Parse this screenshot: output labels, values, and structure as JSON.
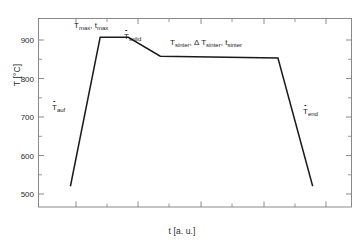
{
  "chart_data": {
    "type": "line",
    "title": "",
    "subtitle": "",
    "xlabel": "t [a. u.]",
    "ylabel": "T [°C]",
    "xlim": [
      0,
      100
    ],
    "ylim": [
      450,
      950
    ],
    "grid": false,
    "legend": "none",
    "x_tick_labels": [],
    "y_tick_labels": [
      "500",
      "600",
      "700",
      "800",
      "900"
    ],
    "y_ticks": [
      500,
      600,
      700,
      800,
      900
    ],
    "y_minor_ticks": [
      450,
      550,
      650,
      750,
      850,
      950
    ],
    "x_major_ticks": [
      10,
      30,
      50,
      70,
      90
    ],
    "x_minor_ticks": [
      20,
      40,
      60,
      80
    ],
    "series": [
      {
        "name": "sintering temperature profile",
        "x": [
          10.2,
          19.7,
          28.7,
          38.9,
          76.5,
          87.6
        ],
        "y": [
          505,
          900,
          900,
          850,
          845,
          505
        ]
      }
    ],
    "annotations": [
      {
        "id": "heating-rate",
        "text": "T_auf",
        "base": "T",
        "sub": "auf",
        "dot": true,
        "x_px": 52,
        "y_px": 108
      },
      {
        "id": "peak-temperature",
        "text": "T_max , t_max",
        "x_px": 74,
        "y_px": 23
      },
      {
        "id": "solidus-cooling-rate",
        "text": "T_solid",
        "base": "T",
        "sub": "solid",
        "dot": true,
        "x_px": 124,
        "y_px": 34
      },
      {
        "id": "sinter-parameters",
        "text": "T_sinter , Δ T_sinter , t_sinter",
        "x_px": 170,
        "y_px": 40
      },
      {
        "id": "end-cooling-rate",
        "text": "T_end",
        "base": "T",
        "sub": "end",
        "dot": true,
        "x_px": 303,
        "y_px": 112
      }
    ]
  },
  "labels": {
    "ylabel": "T [°C]",
    "xlabel": "t [a. u.]",
    "tmax_T": "T",
    "tmax_T_sub": "max",
    "tmax_sep": ", ",
    "tmax_t": "t",
    "tmax_t_sub": "max",
    "tsolid_T": "T",
    "tsolid_sub": "solid",
    "tauf_T": "T",
    "tauf_sub": "auf",
    "tend_T": "T",
    "tend_sub": "end",
    "sinter_T1": "T",
    "sinter_sub1": "sinter",
    "sinter_delta": ", Δ ",
    "sinter_T2": "T",
    "sinter_sub2": "sinter",
    "sinter_sep2": ", ",
    "sinter_t": "t",
    "sinter_sub3": "sinter"
  },
  "ticks": {
    "y0": "500",
    "y1": "600",
    "y2": "700",
    "y3": "800",
    "y4": "900"
  },
  "colors": {
    "curve": "#1a1a1a",
    "frame": "#7d7d7d",
    "text": "#2a2a2a"
  }
}
